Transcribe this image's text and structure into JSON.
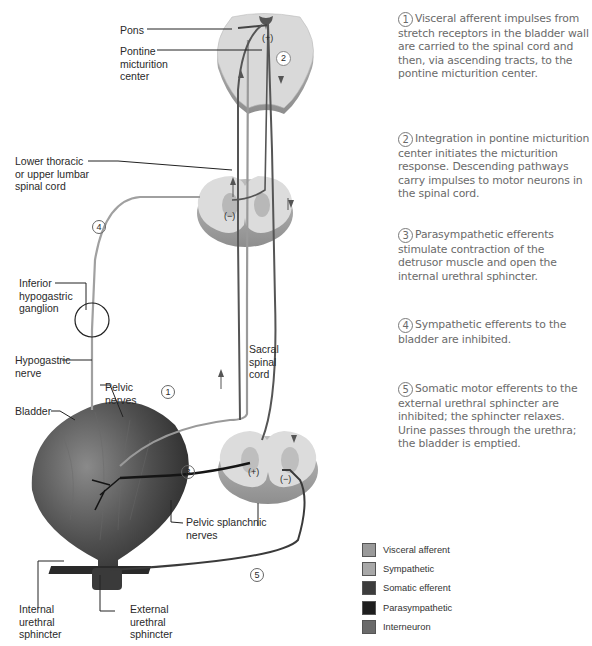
{
  "diagram": {
    "labels": {
      "pons": "Pons",
      "pontine_center": [
        "Pontine",
        "micturition",
        "center"
      ],
      "lower_thoracic": [
        "Lower thoracic",
        "or upper lumbar",
        "spinal cord"
      ],
      "inferior_ganglion": [
        "Inferior",
        "hypogastric",
        "ganglion"
      ],
      "hypogastric_nerve": [
        "Hypogastric",
        "nerve"
      ],
      "pelvic_nerves": [
        "Pelvic",
        "nerves"
      ],
      "bladder": "Bladder",
      "sacral_cord": [
        "Sacral",
        "spinal",
        "cord"
      ],
      "pelvic_splanchnic": [
        "Pelvic splanchnic",
        "nerves"
      ],
      "internal_sphincter": [
        "Internal",
        "urethral",
        "sphincter"
      ],
      "external_sphincter": [
        "External",
        "urethral",
        "sphincter"
      ]
    },
    "markers": {
      "plus": "(+)",
      "minus": "(−)",
      "circle_1": "1",
      "circle_2": "2",
      "circle_3": "3",
      "circle_4": "4",
      "circle_5": "5"
    }
  },
  "steps": [
    {
      "num": "1",
      "text": "Visceral afferent impulses from stretch receptors in the bladder wall are carried to the spinal cord and then, via ascending tracts, to the pontine micturition center."
    },
    {
      "num": "2",
      "text": "Integration in pontine micturition center initiates the micturition response. Descending pathways carry impulses to motor neurons in the spinal cord."
    },
    {
      "num": "3",
      "text": "Parasympathetic efferents stimulate contraction of the detrusor muscle and open the internal urethral sphincter."
    },
    {
      "num": "4",
      "text": "Sympathetic efferents to the bladder are inhibited."
    },
    {
      "num": "5",
      "text": "Somatic motor efferents to the external urethral sphincter are inhibited; the sphincter relaxes. Urine passes through the urethra; the bladder is emptied."
    }
  ],
  "legend": [
    {
      "label": "Visceral afferent",
      "color": "#9a9a9a"
    },
    {
      "label": "Sympathetic",
      "color": "#a8a8a8"
    },
    {
      "label": "Somatic efferent",
      "color": "#3c3c3c"
    },
    {
      "label": "Parasympathetic",
      "color": "#1e1e1e"
    },
    {
      "label": "Interneuron",
      "color": "#6a6a6a"
    }
  ],
  "colors": {
    "afferent": "#a0a0a0",
    "sympathetic": "#9c9c9c",
    "somatic": "#444444",
    "parasympathetic": "#1a1a1a",
    "interneuron": "#5a5a5a",
    "tissue": "#d8d8d8",
    "bladder": "#555555"
  }
}
